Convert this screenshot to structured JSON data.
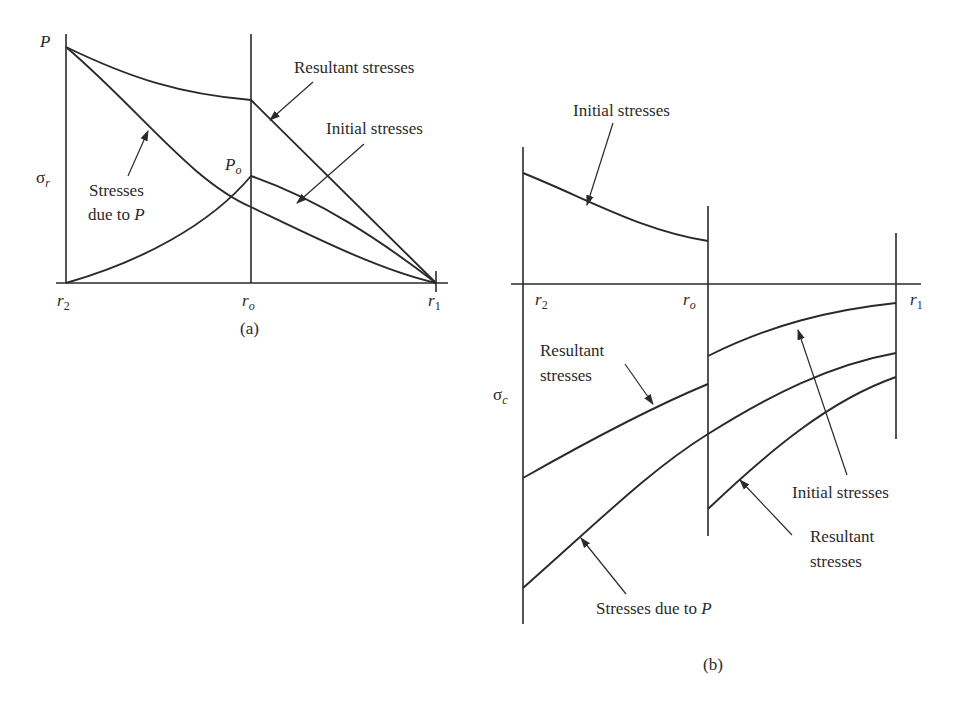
{
  "figure": {
    "panel_a": {
      "caption": "(a)",
      "y_axis_label": "σ",
      "y_axis_sub": "r",
      "top_label": "P",
      "peak_label": "P",
      "peak_sub": "o",
      "x_ticks": [
        {
          "base": "r",
          "sub": "2"
        },
        {
          "base": "r",
          "sub": "o"
        },
        {
          "base": "r",
          "sub": "1"
        }
      ],
      "annotations": {
        "resultant": "Resultant stresses",
        "initial": "Initial stresses",
        "due_to_p_line1": "Stresses",
        "due_to_p_line2": "due to ",
        "due_to_p_italic": "P"
      }
    },
    "panel_b": {
      "caption": "(b)",
      "y_axis_label": "σ",
      "y_axis_sub": "c",
      "x_ticks": [
        {
          "base": "r",
          "sub": "2"
        },
        {
          "base": "r",
          "sub": "o"
        },
        {
          "base": "r",
          "sub": "1"
        }
      ],
      "annotations": {
        "initial_top": "Initial stresses",
        "resultant_left_line1": "Resultant",
        "resultant_left_line2": "stresses",
        "initial_right": "Initial stresses",
        "resultant_right_line1": "Resultant",
        "resultant_right_line2": "stresses",
        "due_to_p": "Stresses due to ",
        "due_to_p_italic": "P"
      }
    },
    "colors": {
      "ink": "#2a2a2a",
      "background": "#ffffff"
    }
  }
}
